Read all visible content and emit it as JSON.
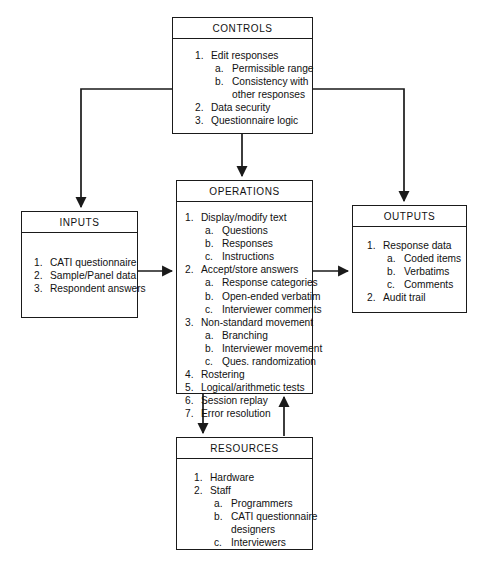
{
  "diagram": {
    "type": "block-flow-diagram",
    "title_style": "uppercase centered header band",
    "boxes": [
      {
        "id": "controls",
        "title": "CONTROLS",
        "items": [
          {
            "marker": "1.",
            "text": "Edit responses",
            "sub": [
              {
                "marker": "a.",
                "text": "Permissible range"
              },
              {
                "marker": "b.",
                "text": "Consistency with",
                "cont": "other responses"
              }
            ]
          },
          {
            "marker": "2.",
            "text": "Data security"
          },
          {
            "marker": "3.",
            "text": "Questionnaire logic"
          }
        ]
      },
      {
        "id": "inputs",
        "title": "INPUTS",
        "items": [
          {
            "marker": "1.",
            "text": "CATI questionnaire"
          },
          {
            "marker": "2.",
            "text": "Sample/Panel data"
          },
          {
            "marker": "3.",
            "text": "Respondent answers"
          }
        ]
      },
      {
        "id": "operations",
        "title": "OPERATIONS",
        "items": [
          {
            "marker": "1.",
            "text": "Display/modify text",
            "sub": [
              {
                "marker": "a.",
                "text": "Questions"
              },
              {
                "marker": "b.",
                "text": "Responses"
              },
              {
                "marker": "c.",
                "text": "Instructions"
              }
            ]
          },
          {
            "marker": "2.",
            "text": "Accept/store answers",
            "sub": [
              {
                "marker": "a.",
                "text": "Response categories"
              },
              {
                "marker": "b.",
                "text": "Open-ended verbatim"
              },
              {
                "marker": "c.",
                "text": "Interviewer comments"
              }
            ]
          },
          {
            "marker": "3.",
            "text": "Non-standard movement",
            "sub": [
              {
                "marker": "a.",
                "text": "Branching"
              },
              {
                "marker": "b.",
                "text": "Interviewer movement"
              },
              {
                "marker": "c.",
                "text": "Ques. randomization"
              }
            ]
          },
          {
            "marker": "4.",
            "text": "Rostering"
          },
          {
            "marker": "5.",
            "text": "Logical/arithmetic tests"
          },
          {
            "marker": "6.",
            "text": "Session replay"
          },
          {
            "marker": "7.",
            "text": "Error resolution"
          }
        ]
      },
      {
        "id": "outputs",
        "title": "OUTPUTS",
        "items": [
          {
            "marker": "1.",
            "text": "Response data",
            "sub": [
              {
                "marker": "a.",
                "text": "Coded items"
              },
              {
                "marker": "b.",
                "text": "Verbatims"
              },
              {
                "marker": "c.",
                "text": "Comments"
              }
            ]
          },
          {
            "marker": "2.",
            "text": "Audit trail"
          }
        ]
      },
      {
        "id": "resources",
        "title": "RESOURCES",
        "items": [
          {
            "marker": "1.",
            "text": "Hardware"
          },
          {
            "marker": "2.",
            "text": "Staff",
            "sub": [
              {
                "marker": "a.",
                "text": "Programmers"
              },
              {
                "marker": "b.",
                "text": "CATI questionnaire",
                "cont": "designers"
              },
              {
                "marker": "c.",
                "text": "Interviewers"
              }
            ]
          }
        ]
      }
    ],
    "connectors": [
      {
        "name": "controls-to-inputs",
        "from": "controls",
        "to": "inputs",
        "shape": "elbow-left-down",
        "arrow": "to"
      },
      {
        "name": "controls-to-outputs",
        "from": "controls",
        "to": "outputs",
        "shape": "elbow-right-down",
        "arrow": "to"
      },
      {
        "name": "controls-to-operations",
        "from": "controls",
        "to": "operations",
        "shape": "vertical",
        "arrow": "to"
      },
      {
        "name": "inputs-to-operations",
        "from": "inputs",
        "to": "operations",
        "shape": "horizontal",
        "arrow": "to"
      },
      {
        "name": "operations-to-outputs",
        "from": "operations",
        "to": "outputs",
        "shape": "horizontal",
        "arrow": "to"
      },
      {
        "name": "operations-to-resources",
        "from": "operations",
        "to": "resources",
        "shape": "vertical",
        "arrow": "to"
      },
      {
        "name": "resources-to-operations",
        "from": "resources",
        "to": "operations",
        "shape": "vertical",
        "arrow": "to"
      }
    ],
    "colors": {
      "line": "#1a1a1a",
      "background": "#ffffff",
      "text": "#111111"
    }
  }
}
